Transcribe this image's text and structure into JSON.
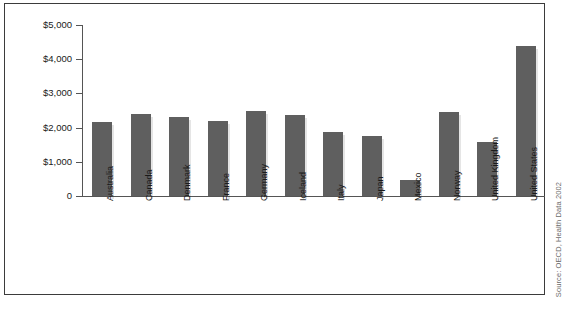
{
  "chart_data": {
    "type": "bar",
    "title": "",
    "xlabel": "",
    "ylabel": "",
    "ylim": [
      0,
      5000
    ],
    "grid": false,
    "legend": null,
    "ytick_labels": [
      "$5,000",
      "$4,000",
      "$3,000",
      "$2,000",
      "$1,000",
      "0"
    ],
    "ytick_values": [
      5000,
      4000,
      3000,
      2000,
      1000,
      0
    ],
    "categories": [
      "Australia",
      "Canada",
      "Denmark",
      "France",
      "Germany",
      "Iceland",
      "Italy",
      "Japan",
      "Mexico",
      "Norway",
      "United Kingdom",
      "United States"
    ],
    "values": [
      2150,
      2390,
      2300,
      2190,
      2500,
      2380,
      1880,
      1760,
      480,
      2450,
      1570,
      4375
    ],
    "bar_color": "#5f5f5f"
  },
  "source": {
    "text": "Source: OECD, Health Data 2002"
  },
  "caption": {
    "text": ""
  }
}
